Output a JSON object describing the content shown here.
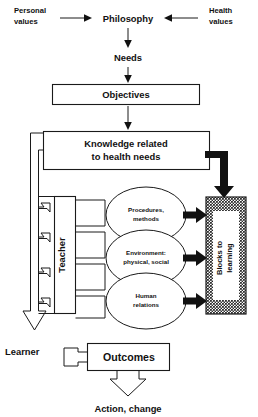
{
  "diagram": {
    "nodes": {
      "personal_values": "Personal\nvalues",
      "personal_values_l1": "Personal",
      "personal_values_l2": "values",
      "health_values_l1": "Health",
      "health_values_l2": "values",
      "philosophy": "Philosophy",
      "needs": "Needs",
      "objectives": "Objectives",
      "knowledge_l1": "Knowledge related",
      "knowledge_l2": "to health needs",
      "teacher": "Teacher",
      "oval1_l1": "Procedures,",
      "oval1_l2": "methods",
      "oval2_l1": "Environment:",
      "oval2_l2": "physical, social",
      "oval3_l1": "Human",
      "oval3_l2": "relations",
      "blocks_l1": "Blocks to",
      "blocks_l2": "learning",
      "learner": "Learner",
      "outcomes": "Outcomes",
      "action": "Action, change"
    },
    "colors": {
      "ink": "#111111",
      "line": "#1a1a1a",
      "paper": "#ffffff",
      "shaded_block": "#a8a8a8"
    },
    "flow": [
      {
        "from": "Personal values",
        "to": "Philosophy"
      },
      {
        "from": "Health values",
        "to": "Philosophy"
      },
      {
        "from": "Philosophy",
        "to": "Needs"
      },
      {
        "from": "Needs",
        "to": "Objectives"
      },
      {
        "from": "Objectives",
        "to": "Knowledge related to health needs"
      },
      {
        "from": "Knowledge related to health needs",
        "to": "Blocks to learning"
      },
      {
        "from": "Knowledge related to health needs",
        "to": "Teacher"
      },
      {
        "from": "Teacher",
        "to": "Procedures, methods"
      },
      {
        "from": "Teacher",
        "to": "Environment: physical, social"
      },
      {
        "from": "Teacher",
        "to": "Human relations"
      },
      {
        "from": "Procedures, methods",
        "to": "Blocks to learning"
      },
      {
        "from": "Environment: physical, social",
        "to": "Blocks to learning"
      },
      {
        "from": "Human relations",
        "to": "Blocks to learning"
      },
      {
        "from": "Teacher",
        "to": "Learner"
      },
      {
        "from": "Learner",
        "to": "Outcomes"
      },
      {
        "from": "Outcomes",
        "to": "Action, change"
      }
    ]
  }
}
